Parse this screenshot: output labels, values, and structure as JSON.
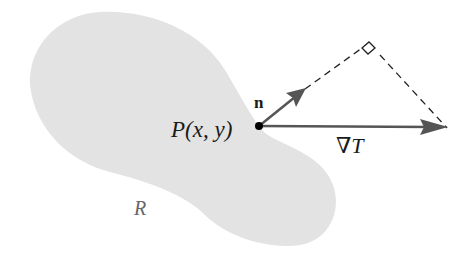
{
  "diagram": {
    "region_label": "R",
    "point_label": "P(x, y)",
    "normal_label": "n",
    "gradient_label": "∇T",
    "colors": {
      "region_fill": "#e3e3e3",
      "arrow": "#555555",
      "dashed": "#222222",
      "point": "#000000",
      "region_label": "#666666"
    }
  }
}
